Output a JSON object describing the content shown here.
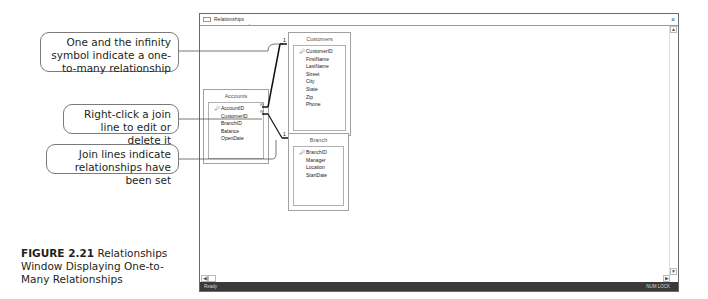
{
  "callouts": [
    {
      "text": "One and the infinity symbol indicate a one-to-many relationship"
    },
    {
      "text": "Right-click a join line to edit or delete it"
    },
    {
      "text": "Join lines indicate relationships have been set"
    }
  ],
  "caption": {
    "label": "FIGURE 2.21",
    "text": " Relationships Window Displaying One-to-Many Relationships"
  },
  "window": {
    "tab_label": "Relationships",
    "close_glyph": "×",
    "status_left": "Ready",
    "status_right": "NUM LOCK",
    "scroll_up": "▲",
    "scroll_down": "▼",
    "scroll_left": "◀",
    "scroll_right": "▶"
  },
  "tables": {
    "customers": {
      "title": "Customers",
      "fields": [
        "CustomerID",
        "FirstName",
        "LastName",
        "Street",
        "City",
        "State",
        "Zip",
        "Phone"
      ],
      "primary_key": "CustomerID"
    },
    "accounts": {
      "title": "Accounts",
      "fields": [
        "AccountID",
        "CustomerID",
        "BranchID",
        "Balance",
        "OpenDate"
      ],
      "primary_key": "AccountID"
    },
    "branch": {
      "title": "Branch",
      "fields": [
        "BranchID",
        "Manager",
        "Location",
        "StartDate"
      ],
      "primary_key": "BranchID"
    }
  },
  "relationships": [
    {
      "from": "Customers.CustomerID",
      "to": "Accounts.CustomerID",
      "one_symbol": "1",
      "many_symbol": "∞"
    },
    {
      "from": "Branch.BranchID",
      "to": "Accounts.BranchID",
      "one_symbol": "1",
      "many_symbol": "∞"
    }
  ]
}
